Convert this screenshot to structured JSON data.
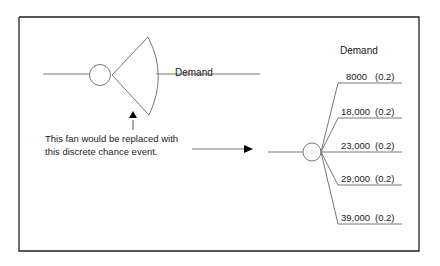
{
  "diagram": {
    "left_node": {
      "label": "Demand",
      "shape": "chance-node-with-fan"
    },
    "annotation": {
      "line1": "This fan would be replaced with",
      "line2": "this discrete chance event."
    },
    "right_node": {
      "header": "Demand",
      "branches": [
        {
          "value": "8000",
          "prob": "(0.2)"
        },
        {
          "value": "18,000",
          "prob": "(0.2)"
        },
        {
          "value": "23,000",
          "prob": "(0.2)"
        },
        {
          "value": "29,000",
          "prob": "(0.2)"
        },
        {
          "value": "39,000",
          "prob": "(0.2)"
        }
      ]
    },
    "colors": {
      "border": "#222222",
      "line": "#777777",
      "arrow": "#000000",
      "text": "#222222"
    }
  }
}
